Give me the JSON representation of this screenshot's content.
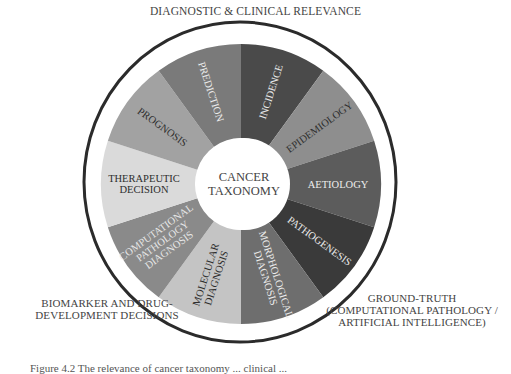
{
  "diagram": {
    "title": "CANCER TAXONOMY",
    "center_lines": [
      "CANCER",
      "TAXONOMY"
    ],
    "outer_labels": {
      "top": "DIAGNOSTIC & CLINICAL RELEVANCE",
      "bottom_left": [
        "BIOMARKER AND DRUG-",
        "DEVELOPMENT DECISIONS"
      ],
      "bottom_right": [
        "GROUND-TRUTH",
        "(COMPUTATIONAL PATHOLOGY /",
        "ARTIFICIAL INTELLIGENCE)"
      ]
    },
    "segments": [
      {
        "label": "INCIDENCE",
        "lines": [
          "INCIDENCE"
        ],
        "color": "#4a4a4a",
        "text_color": "#e8e8e8"
      },
      {
        "label": "EPIDEMIOLOGY",
        "lines": [
          "EPIDEMIOLOGY"
        ],
        "color": "#8e8e8e",
        "text_color": "#2e2e2e"
      },
      {
        "label": "AETIOLOGY",
        "lines": [
          "AETIOLOGY"
        ],
        "color": "#5c5c5c",
        "text_color": "#ececec"
      },
      {
        "label": "PATHOGENESIS",
        "lines": [
          "PATHOGENESIS"
        ],
        "color": "#3a3a3a",
        "text_color": "#ececec"
      },
      {
        "label": "MORPHOLOGICAL DIAGNOSIS",
        "lines": [
          "MORPHOLOGICAL",
          "DIAGNOSIS"
        ],
        "color": "#6e6e6e",
        "text_color": "#ececec"
      },
      {
        "label": "MOLECULAR DIAGNOSIS",
        "lines": [
          "MOLECULAR",
          "DIAGNOSIS"
        ],
        "color": "#c4c4c4",
        "text_color": "#2e2e2e"
      },
      {
        "label": "COMPUTATIONAL PATHOLOGY DIAGNOSIS",
        "lines": [
          "COMPUTATIONAL",
          "PATHOLOGY",
          "DIAGNOSIS"
        ],
        "color": "#8a8a8a",
        "text_color": "#e6e6e6"
      },
      {
        "label": "THERAPEUTIC DECISION",
        "lines": [
          "THERAPEUTIC",
          "DECISION"
        ],
        "color": "#dadada",
        "text_color": "#2e2e2e"
      },
      {
        "label": "PROGNOSIS",
        "lines": [
          "PROGNOSIS"
        ],
        "color": "#a2a2a2",
        "text_color": "#2e2e2e"
      },
      {
        "label": "PREDICTION",
        "lines": [
          "PREDICTION"
        ],
        "color": "#7a7a7a",
        "text_color": "#ececec"
      }
    ]
  },
  "caption": "Figure 4.2   The relevance of cancer taxonomy ... clinical ..."
}
